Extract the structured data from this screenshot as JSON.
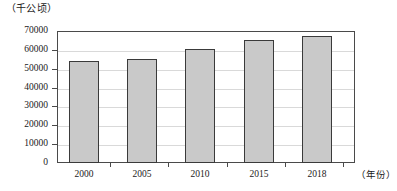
{
  "chart_data": {
    "type": "bar",
    "title": "",
    "subtitle": "",
    "xlabel": "（年份）",
    "ylabel": "（千公顷）",
    "categories": [
      "2000",
      "2005",
      "2010",
      "2015",
      "2018"
    ],
    "values": [
      54000,
      55000,
      60500,
      65500,
      67500
    ],
    "series": [
      {
        "name": "",
        "values": [
          54000,
          55000,
          60500,
          65500,
          67500
        ]
      }
    ],
    "ylim": [
      0,
      70000
    ],
    "y_ticks": [
      0,
      10000,
      20000,
      30000,
      40000,
      50000,
      60000,
      70000
    ],
    "y_tick_labels": [
      "0",
      "10000",
      "20000",
      "30000",
      "40000",
      "50000",
      "60000",
      "70000"
    ],
    "grid": true,
    "grid_axis": "y",
    "legend": false,
    "legend_position": "none",
    "bar_fill_color": "#c9c9c9",
    "bar_border_color": "#3a3a3a",
    "gridline_color": "#d9d9d9",
    "axis_color": "#4a4a4a",
    "annotations": []
  },
  "axes": {
    "y_unit_label": "（千公顷）",
    "x_unit_label": "（年份）"
  }
}
